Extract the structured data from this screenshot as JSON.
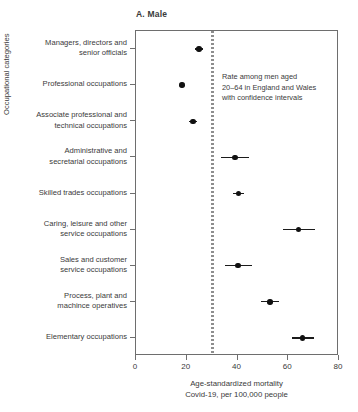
{
  "chart_data": {
    "type": "scatter",
    "title": "A. Male",
    "xlabel": "Age-standardized mortality\nCovid-19, per 100,000 people",
    "xlabel_line1": "Age-standardized mortality",
    "xlabel_line2": "Covid-19, per 100,000 people",
    "ylabel": "Occupational categories",
    "xlim": [
      0,
      80
    ],
    "xticks": [
      0,
      20,
      40,
      60,
      80
    ],
    "xticklabels": [
      "0",
      "20",
      "40",
      "60",
      "80"
    ],
    "grid": false,
    "legend": null,
    "orientation": "horizontal",
    "reference_line": {
      "value": 30.3,
      "style": "dashed",
      "color": "#8e8e8e",
      "label": "All men aged 20-64 rate"
    },
    "annotation": {
      "line1": "Rate among men aged",
      "line2": "20–64 in England and Wales",
      "line3": "with confidence intervals"
    },
    "categories": [
      "Managers, directors and\nsenior officials",
      "Professional occupations",
      "Associate professional and\ntechnical occupations",
      "Administrative and\nsecretarial occupations",
      "Skilled trades occupations",
      "Caring, leisure and other\nservice occupations",
      "Sales and customer\nservice occupations",
      "Process, plant and\nmachince operatives",
      "Elementary occupations"
    ],
    "points": [
      {
        "category": "Managers, directors and senior officials",
        "value": 24.8,
        "ci_low": 23.3,
        "ci_high": 26.5
      },
      {
        "category": "Professional occupations",
        "value": 18.1,
        "ci_low": 17.0,
        "ci_high": 19.3
      },
      {
        "category": "Associate professional and technical occupations",
        "value": 22.4,
        "ci_low": 21.0,
        "ci_high": 23.9
      },
      {
        "category": "Administrative and secretarial occupations",
        "value": 39.0,
        "ci_low": 33.6,
        "ci_high": 44.5
      },
      {
        "category": "Skilled trades occupations",
        "value": 40.5,
        "ci_low": 38.4,
        "ci_high": 42.6
      },
      {
        "category": "Caring, leisure and other service occupations",
        "value": 64.1,
        "ci_low": 58.0,
        "ci_high": 70.5
      },
      {
        "category": "Sales and customer service occupations",
        "value": 40.2,
        "ci_low": 34.9,
        "ci_high": 45.8
      },
      {
        "category": "Process, plant and machince operatives",
        "value": 52.8,
        "ci_low": 49.3,
        "ci_high": 56.4
      },
      {
        "category": "Elementary occupations",
        "value": 65.7,
        "ci_low": 61.5,
        "ci_high": 70.0
      }
    ],
    "colors": {
      "marker": "#111111",
      "axis": "#6e6e6e",
      "text": "#3a3a3a",
      "reference": "#8e8e8e"
    }
  }
}
